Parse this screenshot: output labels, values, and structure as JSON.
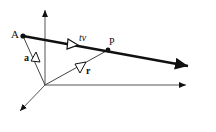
{
  "diagram": {
    "title": "",
    "colors": {
      "stroke": "#111111",
      "axis": "#555555",
      "background": "#ffffff"
    },
    "axes": {
      "origin": [
        45,
        85
      ],
      "vertical_end": [
        45,
        8
      ],
      "horizontal_end": [
        187,
        85
      ],
      "depth_end": [
        18,
        113
      ]
    },
    "points": [
      {
        "id": "A",
        "label": "A",
        "pos": [
          23,
          36
        ]
      },
      {
        "id": "P",
        "label": "P",
        "pos": [
          108,
          50
        ]
      }
    ],
    "line": {
      "from": [
        23,
        36
      ],
      "to": [
        190,
        66
      ]
    },
    "vectors": [
      {
        "id": "a",
        "label": "a",
        "from": [
          45,
          85
        ],
        "to": [
          23,
          36
        ]
      },
      {
        "id": "r",
        "label": "r",
        "from": [
          45,
          85
        ],
        "to": [
          108,
          50
        ]
      },
      {
        "id": "tv",
        "label": "tv",
        "from": [
          23,
          36
        ],
        "to": [
          108,
          50
        ]
      }
    ],
    "labels": {
      "A": "A",
      "P": "P",
      "a": "a",
      "r": "r",
      "tv": "tv"
    }
  }
}
